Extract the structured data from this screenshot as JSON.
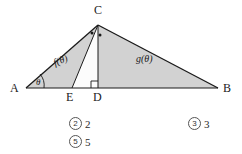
{
  "figure": {
    "type": "geometry-diagram",
    "stroke_color": "#1a1a1a",
    "fill_color": "#d2d2d2",
    "background": "#ffffff",
    "vertices": [
      {
        "name": "A",
        "label": "A",
        "x": 26,
        "y": 88,
        "label_x": 10,
        "label_y": 92
      },
      {
        "name": "B",
        "label": "B",
        "x": 218,
        "y": 88,
        "label_x": 223,
        "label_y": 92
      },
      {
        "name": "C",
        "label": "C",
        "x": 98,
        "y": 25,
        "label_x": 94,
        "label_y": 14
      },
      {
        "name": "D",
        "label": "D",
        "x": 98,
        "y": 88,
        "label_x": 93,
        "label_y": 101
      },
      {
        "name": "E",
        "label": "E",
        "x": 72,
        "y": 88,
        "label_x": 66,
        "label_y": 101
      }
    ],
    "segments": [
      {
        "name": "segment-AB",
        "from": "A",
        "to": "B"
      },
      {
        "name": "segment-AC",
        "from": "A",
        "to": "C"
      },
      {
        "name": "segment-CB",
        "from": "C",
        "to": "B"
      },
      {
        "name": "segment-CD",
        "from": "C",
        "to": "D"
      },
      {
        "name": "segment-CE",
        "from": "C",
        "to": "E"
      }
    ],
    "shaded_regions": [
      {
        "name": "region-ACE",
        "label": "f(θ)",
        "label_x": 55,
        "label_y": 66
      },
      {
        "name": "region-CDB",
        "label": "g(θ)",
        "label_x": 136,
        "label_y": 62
      }
    ],
    "angle_marks": [
      {
        "name": "angle-theta-at-A",
        "label": "θ",
        "label_x": 36,
        "label_y": 84
      },
      {
        "name": "right-angle-at-D",
        "label": ""
      },
      {
        "name": "equal-angle-dot-ACE",
        "label": ""
      },
      {
        "name": "equal-angle-dot-ECD",
        "label": ""
      }
    ]
  },
  "choices": [
    {
      "name": "choice-2",
      "number": "②",
      "number_text": "2",
      "value": "2"
    },
    {
      "name": "choice-3",
      "number": "③",
      "number_text": "3",
      "value": "3"
    },
    {
      "name": "choice-5",
      "number": "⑤",
      "number_text": "5",
      "value": "5"
    }
  ]
}
